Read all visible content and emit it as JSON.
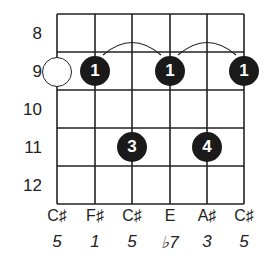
{
  "diagram": {
    "type": "guitar-chord-diagram",
    "fret_numbers": [
      "8",
      "9",
      "10",
      "11",
      "12"
    ],
    "strings": [
      {
        "note": "C♯",
        "interval": "5"
      },
      {
        "note": "F♯",
        "interval": "1"
      },
      {
        "note": "C♯",
        "interval": "5"
      },
      {
        "note": "E",
        "interval": "♭7"
      },
      {
        "note": "A♯",
        "interval": "3"
      },
      {
        "note": "C♯",
        "interval": "5"
      }
    ],
    "fingerings": [
      {
        "string": 2,
        "fret": "9",
        "finger": "1"
      },
      {
        "string": 4,
        "fret": "9",
        "finger": "1"
      },
      {
        "string": 6,
        "fret": "9",
        "finger": "1"
      },
      {
        "string": 3,
        "fret": "11",
        "finger": "3"
      },
      {
        "string": 5,
        "fret": "11",
        "finger": "4"
      }
    ],
    "open_marker": {
      "string": 1,
      "fret": "9",
      "style": "hollow-circle"
    },
    "ties": [
      {
        "from_string": 2,
        "to_string": 4,
        "fret": "9"
      },
      {
        "from_string": 4,
        "to_string": 6,
        "fret": "9"
      }
    ],
    "colors": {
      "line": "#222222",
      "dot": "#1a1a1a",
      "dot_text": "#ffffff",
      "background": "#ffffff"
    }
  }
}
